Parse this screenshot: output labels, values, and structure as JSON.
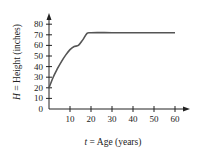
{
  "chart_data": {
    "type": "line",
    "title": "",
    "xlabel": "t = Age (years)",
    "ylabel": "H = Height (inches)",
    "xlim": [
      0,
      62
    ],
    "ylim": [
      0,
      85
    ],
    "x_ticks": [
      10,
      20,
      30,
      40,
      50,
      60
    ],
    "y_ticks": [
      0,
      10,
      20,
      30,
      40,
      50,
      60,
      70,
      80
    ],
    "grid": false,
    "legend": null,
    "series": [
      {
        "name": "Height",
        "x": [
          0,
          2,
          4,
          6,
          8,
          10,
          12,
          14,
          16,
          18,
          20,
          30,
          40,
          50,
          60
        ],
        "y": [
          20,
          30,
          38,
          45,
          51,
          56,
          59,
          60,
          65,
          71,
          72,
          72,
          72,
          72,
          72
        ]
      }
    ]
  },
  "labels": {
    "xlabel_var": "t",
    "xlabel_rest": " = Age (years)",
    "ylabel_var": "H",
    "ylabel_rest": " = Height (inches)",
    "x_tick_labels": [
      "10",
      "20",
      "30",
      "40",
      "50",
      "60"
    ],
    "y_tick_labels": [
      "0",
      "10",
      "20",
      "30",
      "40",
      "50",
      "60",
      "70",
      "80"
    ]
  }
}
